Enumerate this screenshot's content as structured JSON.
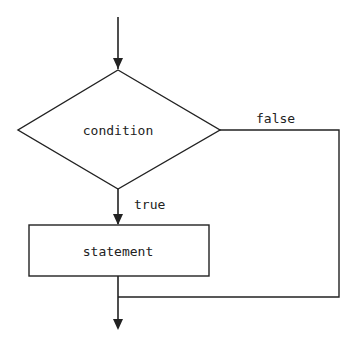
{
  "diagram": {
    "type": "flowchart",
    "nodes": [
      {
        "id": "condition",
        "shape": "diamond",
        "label": "condition"
      },
      {
        "id": "statement",
        "shape": "rectangle",
        "label": "statement"
      }
    ],
    "edges": [
      {
        "from": "start",
        "to": "condition",
        "label": ""
      },
      {
        "from": "condition",
        "to": "statement",
        "label": "true"
      },
      {
        "from": "condition",
        "to": "end",
        "label": "false"
      },
      {
        "from": "statement",
        "to": "end",
        "label": ""
      }
    ],
    "labels": {
      "condition": "condition",
      "statement": "statement",
      "true": "true",
      "false": "false"
    },
    "colors": {
      "stroke": "#222222",
      "background": "#ffffff"
    }
  }
}
